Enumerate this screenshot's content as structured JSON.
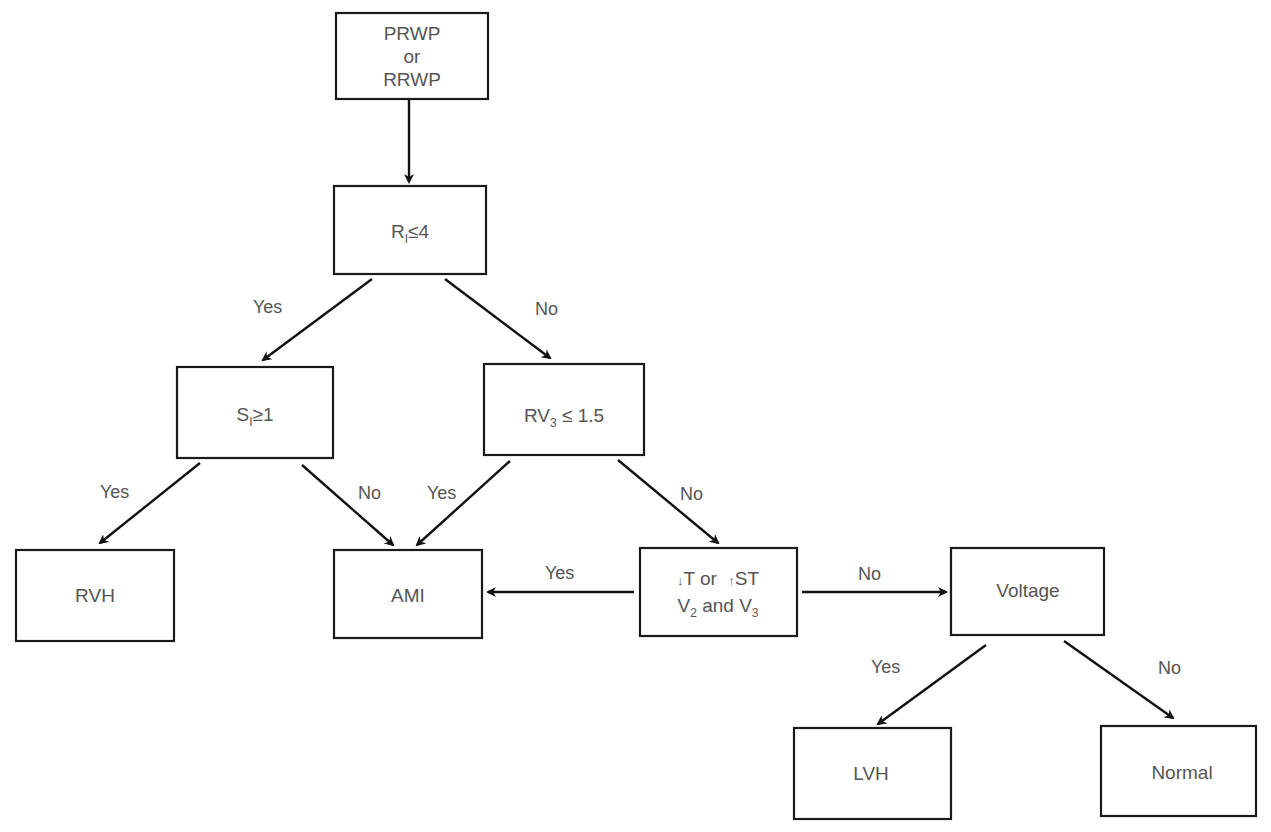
{
  "diagram": {
    "type": "decision-flowchart",
    "nodes": [
      {
        "id": "start",
        "lines": [
          "PRWP",
          "or",
          "RRWP"
        ]
      },
      {
        "id": "r1",
        "main": "R",
        "sub": "I",
        "rest": "≤4"
      },
      {
        "id": "s1",
        "main": "S",
        "sub": "I",
        "rest": "≥1"
      },
      {
        "id": "rv3",
        "main": "RV",
        "sub": "3",
        "rest": " ≤ 1.5"
      },
      {
        "id": "rvh",
        "label": "RVH"
      },
      {
        "id": "ami",
        "label": "AMI"
      },
      {
        "id": "tst",
        "line1_a": "T or ",
        "line1_b": "ST",
        "line2_v": "V",
        "line2_s1": "2",
        "line2_mid": " and V",
        "line2_s2": "3",
        "down_arrow": "↓",
        "up_arrow": "↑"
      },
      {
        "id": "voltage",
        "label": "Voltage"
      },
      {
        "id": "lvh",
        "label": "LVH"
      },
      {
        "id": "normal",
        "label": "Normal"
      }
    ],
    "edges": [
      {
        "from": "start",
        "to": "r1",
        "label": ""
      },
      {
        "from": "r1",
        "to": "s1",
        "label": "Yes"
      },
      {
        "from": "r1",
        "to": "rv3",
        "label": "No"
      },
      {
        "from": "s1",
        "to": "rvh",
        "label": "Yes"
      },
      {
        "from": "s1",
        "to": "ami",
        "label": "No"
      },
      {
        "from": "rv3",
        "to": "ami",
        "label": "Yes"
      },
      {
        "from": "rv3",
        "to": "tst",
        "label": "No"
      },
      {
        "from": "tst",
        "to": "ami",
        "label": "Yes"
      },
      {
        "from": "tst",
        "to": "voltage",
        "label": "No"
      },
      {
        "from": "voltage",
        "to": "lvh",
        "label": "Yes"
      },
      {
        "from": "voltage",
        "to": "normal",
        "label": "No"
      }
    ]
  }
}
